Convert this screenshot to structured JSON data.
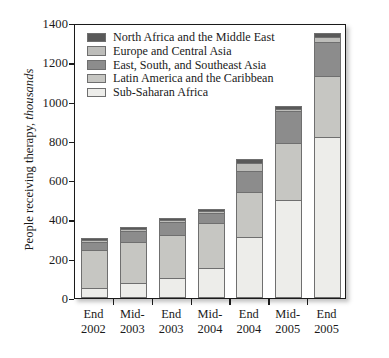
{
  "chart_data": {
    "type": "bar",
    "subtype": "stacked-vertical",
    "title": "",
    "xlabel": "",
    "ylabel": "People receiving therapy, thousands",
    "ylabel_plain": "People receiving therapy, ",
    "ylabel_italic": "thousands",
    "ylim": [
      0,
      1400
    ],
    "yticks": [
      0,
      200,
      400,
      600,
      800,
      1000,
      1200,
      1400
    ],
    "ytick_labels": [
      "0",
      "200",
      "400",
      "600",
      "800",
      "1000",
      "1200",
      "1400"
    ],
    "grid": false,
    "legend_position": "top-left-inside",
    "categories": [
      "End\n2002",
      "Mid-\n2003",
      "End\n2003",
      "Mid-\n2004",
      "End\n2004",
      "Mid-\n2005",
      "End\n2005"
    ],
    "category_lines": [
      [
        "End",
        "2002"
      ],
      [
        "Mid-",
        "2003"
      ],
      [
        "End",
        "2003"
      ],
      [
        "Mid-",
        "2004"
      ],
      [
        "End",
        "2004"
      ],
      [
        "Mid-",
        "2005"
      ],
      [
        "End",
        "2005"
      ]
    ],
    "stack_order_bottom_to_top": [
      "Sub-Saharan Africa",
      "Latin America and the Caribbean",
      "East, South, and Southeast Asia",
      "Europe and Central Asia",
      "North Africa and the Middle East"
    ],
    "series": [
      {
        "name": "Sub-Saharan Africa",
        "color": "#ededea",
        "values": [
          50,
          75,
          100,
          155,
          310,
          500,
          820
        ]
      },
      {
        "name": "Latin America and the Caribbean",
        "color": "#c6c6c2",
        "values": [
          196,
          210,
          220,
          225,
          230,
          290,
          310
        ]
      },
      {
        "name": "East, South, and Southeast Asia",
        "color": "#8c8c8c",
        "values": [
          40,
          55,
          65,
          55,
          105,
          160,
          175
        ]
      },
      {
        "name": "Europe and Central Asia",
        "color": "#bdbdba",
        "values": [
          9,
          11,
          12,
          8,
          43,
          13,
          25
        ]
      },
      {
        "name": "North Africa and the Middle East",
        "color": "#595959",
        "values": [
          10,
          10,
          10,
          10,
          20,
          15,
          20
        ]
      }
    ],
    "totals": [
      305,
      361,
      407,
      453,
      708,
      978,
      1350
    ],
    "legend_entries": [
      {
        "label": "North Africa and the Middle East",
        "color": "#595959"
      },
      {
        "label": "Europe and Central Asia",
        "color": "#bdbdba"
      },
      {
        "label": "East, South, and Southeast Asia",
        "color": "#8c8c8c"
      },
      {
        "label": "Latin America and the Caribbean",
        "color": "#c6c6c2"
      },
      {
        "label": "Sub-Saharan Africa",
        "color": "#ededea"
      }
    ],
    "colors": {
      "axis": "#1a1a1a",
      "bar_outline": "#6f6f6f",
      "background": "#ffffff"
    }
  }
}
